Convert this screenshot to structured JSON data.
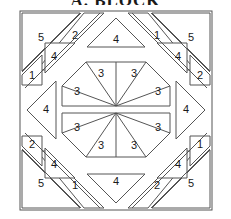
{
  "figure": {
    "title": "A. BLOCK",
    "type": "quilt-block-piecing-diagram",
    "width": 231,
    "height": 219,
    "line_color": "#555555",
    "fill_color": "#ffffff",
    "text_color": "#1a1a1a"
  },
  "pieces": {
    "center": {
      "group_name": "center-octagon",
      "count": 8,
      "labels": [
        "3",
        "3",
        "3",
        "3",
        "3",
        "3",
        "3",
        "3"
      ]
    },
    "edges": {
      "group_name": "edge-triangles",
      "count": 4,
      "labels": [
        "4",
        "4",
        "4",
        "4"
      ],
      "positions": [
        "top",
        "right",
        "bottom",
        "left"
      ]
    },
    "corners": {
      "group_name": "corner-units",
      "top_left": [
        "5",
        "2",
        "4",
        "1"
      ],
      "top_right": [
        "1",
        "5",
        "4",
        "2"
      ],
      "bottom_left": [
        "2",
        "4",
        "5",
        "1"
      ],
      "bottom_right": [
        "1",
        "4",
        "2",
        "5"
      ]
    }
  },
  "labels": {
    "c_tl_a": "5",
    "c_tl_b": "2",
    "c_tl_c": "4",
    "c_tl_d": "1",
    "c_tr_a": "1",
    "c_tr_b": "5",
    "c_tr_c": "4",
    "c_tr_d": "2",
    "c_bl_a": "2",
    "c_bl_b": "4",
    "c_bl_c": "5",
    "c_bl_d": "1",
    "c_br_a": "1",
    "c_br_b": "4",
    "c_br_c": "2",
    "c_br_d": "5",
    "e_top": "4",
    "e_right": "4",
    "e_bottom": "4",
    "e_left": "4",
    "o_1": "3",
    "o_2": "3",
    "o_3": "3",
    "o_4": "3",
    "o_5": "3",
    "o_6": "3",
    "o_7": "3",
    "o_8": "3"
  }
}
